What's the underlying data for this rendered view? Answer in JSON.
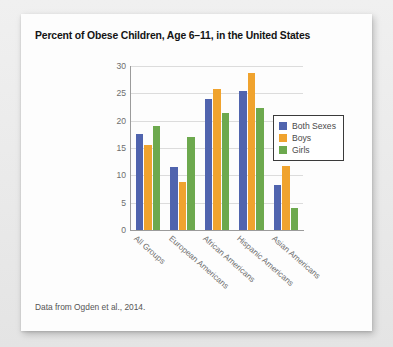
{
  "chart_data": {
    "type": "bar",
    "title": "Percent of Obese Children, Age 6–11, in the United States",
    "xlabel": "",
    "ylabel": "",
    "ylim": [
      0,
      30
    ],
    "yticks": [
      "0",
      "5",
      "10",
      "15",
      "20",
      "25",
      "30"
    ],
    "grid": true,
    "legend_position": "right",
    "categories": [
      "All Groups",
      "European Americans",
      "African Americans",
      "Hispanic Americans",
      "Asian Americans"
    ],
    "series": [
      {
        "name": "Both Sexes",
        "color": "#5064ae",
        "values": [
          17.5,
          11.5,
          24.0,
          25.5,
          8.2
        ]
      },
      {
        "name": "Boys",
        "color": "#f0a32e",
        "values": [
          15.6,
          8.8,
          25.8,
          28.8,
          11.7
        ]
      },
      {
        "name": "Girls",
        "color": "#6da94e",
        "values": [
          19.0,
          17.1,
          21.4,
          22.4,
          4.0
        ]
      }
    ],
    "caption": "Data from Ogden et al., 2014."
  }
}
